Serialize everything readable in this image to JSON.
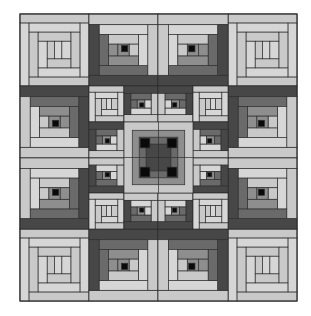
{
  "image": {
    "title": "Log cabin quilt pattern",
    "width": 311,
    "height": 316,
    "background": "#ffffff"
  },
  "palette": {
    "black": "#0a0a0a",
    "dark": "#474747",
    "mediumdark": "#6a6a6a",
    "medium": "#8e8e8e",
    "light": "#c9c9c9",
    "lighter": "#d6d6d6",
    "line": "#2e2e2e"
  },
  "quilt": {
    "x": 20,
    "y": 14,
    "w": 277,
    "h": 287,
    "grid": {
      "cols": 4,
      "rows": 4
    }
  },
  "blocks": [
    {
      "name": "corner-block-top-left",
      "type": "concentric",
      "x": 20,
      "y": 14,
      "w": 69,
      "h": 72
    },
    {
      "name": "corner-block-top-right",
      "type": "concentric",
      "x": 228,
      "y": 14,
      "w": 69,
      "h": 72
    },
    {
      "name": "corner-block-bottom-left",
      "type": "concentric",
      "x": 20,
      "y": 229,
      "w": 69,
      "h": 72
    },
    {
      "name": "corner-block-bottom-right",
      "type": "concentric",
      "x": 228,
      "y": 229,
      "w": 69,
      "h": 72
    },
    {
      "name": "edge-block-top-1",
      "type": "cabin",
      "x": 89,
      "y": 14,
      "w": 69,
      "h": 72,
      "center": "tr",
      "darkSides": [
        "left",
        "bottom"
      ]
    },
    {
      "name": "edge-block-top-2",
      "type": "cabin",
      "x": 158,
      "y": 14,
      "w": 70,
      "h": 72,
      "center": "tl",
      "darkSides": [
        "right",
        "bottom"
      ]
    },
    {
      "name": "edge-block-bottom-1",
      "type": "cabin",
      "x": 89,
      "y": 229,
      "w": 69,
      "h": 72,
      "center": "br",
      "darkSides": [
        "left",
        "top"
      ]
    },
    {
      "name": "edge-block-bottom-2",
      "type": "cabin",
      "x": 158,
      "y": 229,
      "w": 70,
      "h": 72,
      "center": "bl",
      "darkSides": [
        "right",
        "top"
      ]
    },
    {
      "name": "edge-block-left-1",
      "type": "cabin",
      "x": 20,
      "y": 86,
      "w": 69,
      "h": 72,
      "center": "br",
      "darkSides": [
        "top",
        "right"
      ]
    },
    {
      "name": "edge-block-left-2",
      "type": "cabin",
      "x": 20,
      "y": 158,
      "w": 69,
      "h": 71,
      "center": "tr",
      "darkSides": [
        "bottom",
        "right"
      ]
    },
    {
      "name": "edge-block-right-1",
      "type": "cabin",
      "x": 228,
      "y": 86,
      "w": 69,
      "h": 72,
      "center": "bl",
      "darkSides": [
        "top",
        "left"
      ]
    },
    {
      "name": "edge-block-right-2",
      "type": "cabin",
      "x": 228,
      "y": 158,
      "w": 69,
      "h": 71,
      "center": "tl",
      "darkSides": [
        "bottom",
        "left"
      ]
    },
    {
      "name": "inner-small-1",
      "type": "concentric-small",
      "x": 89,
      "y": 86,
      "w": 35,
      "h": 36
    },
    {
      "name": "inner-small-2",
      "type": "cabin-small",
      "x": 124,
      "y": 86,
      "w": 34,
      "h": 36,
      "center": "br",
      "darkSides": [
        "top",
        "left"
      ]
    },
    {
      "name": "inner-small-3",
      "type": "cabin-small",
      "x": 158,
      "y": 86,
      "w": 35,
      "h": 36,
      "center": "bl",
      "darkSides": [
        "top",
        "right"
      ]
    },
    {
      "name": "inner-small-4",
      "type": "concentric-small",
      "x": 193,
      "y": 86,
      "w": 35,
      "h": 36
    },
    {
      "name": "inner-small-5",
      "type": "cabin-small",
      "x": 89,
      "y": 122,
      "w": 35,
      "h": 36,
      "center": "br",
      "darkSides": [
        "left",
        "top"
      ]
    },
    {
      "name": "inner-small-6",
      "type": "cabin-small",
      "x": 193,
      "y": 122,
      "w": 35,
      "h": 36,
      "center": "bl",
      "darkSides": [
        "right",
        "top"
      ]
    },
    {
      "name": "inner-small-7",
      "type": "cabin-small",
      "x": 89,
      "y": 158,
      "w": 35,
      "h": 35,
      "center": "tr",
      "darkSides": [
        "left",
        "bottom"
      ]
    },
    {
      "name": "inner-small-8",
      "type": "cabin-small",
      "x": 193,
      "y": 158,
      "w": 35,
      "h": 35,
      "center": "tl",
      "darkSides": [
        "right",
        "bottom"
      ]
    },
    {
      "name": "inner-small-9",
      "type": "concentric-small",
      "x": 89,
      "y": 193,
      "w": 35,
      "h": 36
    },
    {
      "name": "inner-small-10",
      "type": "cabin-small",
      "x": 124,
      "y": 193,
      "w": 34,
      "h": 36,
      "center": "tr",
      "darkSides": [
        "bottom",
        "left"
      ]
    },
    {
      "name": "inner-small-11",
      "type": "cabin-small",
      "x": 158,
      "y": 193,
      "w": 35,
      "h": 36,
      "center": "tl",
      "darkSides": [
        "bottom",
        "right"
      ]
    },
    {
      "name": "inner-small-12",
      "type": "concentric-small",
      "x": 193,
      "y": 193,
      "w": 35,
      "h": 36
    },
    {
      "name": "center-medallion",
      "type": "medallion",
      "x": 124,
      "y": 122,
      "w": 69,
      "h": 71
    }
  ]
}
